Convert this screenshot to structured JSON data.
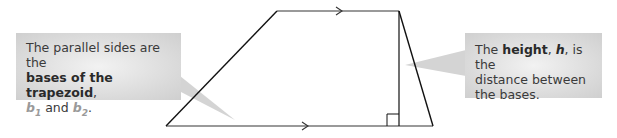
{
  "diagram": {
    "shape": "trapezoid",
    "vertices": {
      "top_left": [
        277,
        11
      ],
      "top_right": [
        399,
        11
      ],
      "bottom_right": [
        433,
        126
      ],
      "bottom_left": [
        166,
        126
      ]
    },
    "parallel_marks": [
      "top-base-arrow",
      "bottom-base-arrow"
    ],
    "height_segment": {
      "x": 399,
      "y1": 11,
      "y2": 126,
      "right_angle_marker": true
    },
    "colors": {
      "stroke": "#111111",
      "base_stroke": "#777777",
      "callout_bg": "#d9d9d9",
      "callout_text": "#3a3a3a",
      "variable_color": "#9a9a9a"
    }
  },
  "callouts": {
    "left": {
      "line1": "The parallel sides are the",
      "bold": "bases of the trapezoid",
      "comma": ",",
      "b1_var": "b",
      "b1_sub": "1",
      "and": " and ",
      "b2_var": "b",
      "b2_sub": "2",
      "period": "."
    },
    "right": {
      "prefix": "The ",
      "bold": "height",
      "comma1": ", ",
      "var": "h",
      "suffix1": ", is the",
      "line2": "distance between",
      "line3": "the bases."
    }
  }
}
